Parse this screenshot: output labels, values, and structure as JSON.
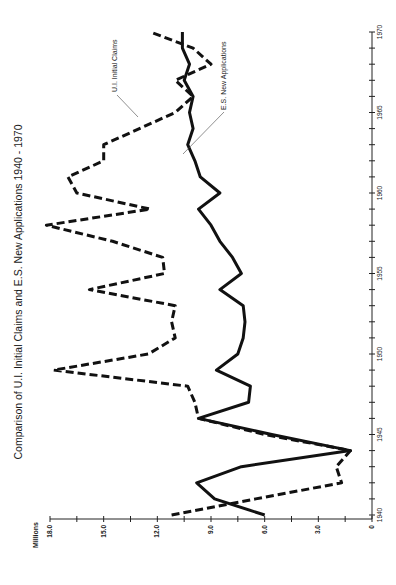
{
  "chart_data": {
    "type": "line",
    "title": "Comparison of U.I. Initial Claims and E.S. New Applications 1940 - 1970",
    "xlabel": "",
    "ylabel": "Millions",
    "orientation": "rotated-90-ccw",
    "xlim": [
      1940,
      1970
    ],
    "ylim": [
      0,
      18
    ],
    "x_ticks": [
      1940,
      1945,
      1950,
      1955,
      1960,
      1965,
      1970
    ],
    "y_ticks": [
      "0",
      "3.0",
      "6.0",
      "9.0",
      "12.0",
      "15.0",
      "18.0"
    ],
    "grid": false,
    "x": [
      1940,
      1941,
      1942,
      1943,
      1944,
      1945,
      1946,
      1947,
      1948,
      1949,
      1950,
      1951,
      1952,
      1953,
      1954,
      1955,
      1956,
      1957,
      1958,
      1959,
      1960,
      1961,
      1962,
      1963,
      1964,
      1965,
      1966,
      1967,
      1968,
      1969,
      1970
    ],
    "series": [
      {
        "name": "U.I. Initial Claims",
        "style": "dashed",
        "values": [
          11.2,
          6.5,
          1.7,
          2.0,
          1.2,
          6.0,
          9.7,
          9.9,
          10.3,
          17.8,
          12.5,
          11.0,
          11.2,
          11.0,
          15.8,
          11.6,
          11.7,
          14.5,
          18.2,
          12.4,
          16.5,
          17.0,
          15.0,
          15.0,
          13.0,
          11.0,
          10.0,
          11.0,
          9.0,
          10.0,
          12.4
        ]
      },
      {
        "name": "E.S. New Applications",
        "style": "solid",
        "values": [
          6.0,
          8.8,
          9.8,
          7.3,
          1.2,
          5.6,
          9.7,
          6.9,
          6.8,
          8.7,
          7.5,
          7.2,
          7.1,
          7.2,
          8.5,
          7.3,
          7.8,
          8.5,
          9.0,
          9.7,
          8.5,
          9.6,
          9.9,
          10.3,
          10.0,
          10.2,
          10.0,
          10.5,
          10.2,
          10.6,
          10.6
        ]
      }
    ],
    "annotations": [
      {
        "text": "U.I. Initial Claims",
        "points_to": "dashed series near 1964"
      },
      {
        "text": "E.S. New Applications",
        "points_to": "solid series near 1963"
      }
    ]
  },
  "labels": {
    "title": "Comparison of U.I. Initial Claims and E.S. New Applications 1940 - 1970",
    "y_unit": "Millions",
    "ann_ui": "U.I. Initial Claims",
    "ann_es": "E.S. New Applications"
  }
}
